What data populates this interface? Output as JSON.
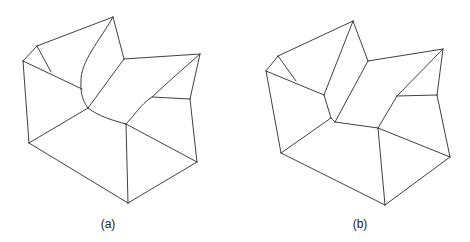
{
  "figure": {
    "panels": [
      {
        "id": "a",
        "label": "(a)",
        "label_pos": [
          108,
          218
        ],
        "description": "Polyhedral surface mesh with curved edges around central concave region",
        "lines": [
          [
            [
              113,
              17
            ],
            [
              37,
              46
            ]
          ],
          [
            [
              37,
              46
            ],
            [
              23,
              61
            ]
          ],
          [
            [
              37,
              46
            ],
            [
              51,
              72
            ]
          ],
          [
            [
              23,
              61
            ],
            [
              82,
              89
            ]
          ],
          [
            [
              23,
              61
            ],
            [
              29,
              143
            ]
          ],
          [
            [
              113,
              17
            ],
            [
              124,
              59
            ]
          ],
          [
            [
              124,
              59
            ],
            [
              200,
              54
            ]
          ],
          [
            [
              124,
              59
            ],
            [
              88,
              108
            ]
          ],
          [
            [
              200,
              54
            ],
            [
              190,
              99
            ]
          ],
          [
            [
              190,
              99
            ],
            [
              152,
              97
            ]
          ],
          [
            [
              190,
              99
            ],
            [
              197,
              162
            ]
          ],
          [
            [
              29,
              143
            ],
            [
              88,
              108
            ]
          ],
          [
            [
              29,
              143
            ],
            [
              128,
              203
            ]
          ],
          [
            [
              126,
              124
            ],
            [
              128,
              203
            ]
          ],
          [
            [
              126,
              124
            ],
            [
              197,
              162
            ]
          ],
          [
            [
              128,
              203
            ],
            [
              197,
              162
            ]
          ]
        ],
        "curves": [
          "M113,17 C100,40 80,62 81,82 C80,96 85,104 88,108",
          "M88,108 C100,117 112,120 126,124",
          "M126,124 C134,116 140,105 152,97 C168,82 184,68 200,54"
        ]
      },
      {
        "id": "b",
        "label": "(b)",
        "label_pos": [
          360,
          218
        ],
        "description": "Polyhedral surface mesh with straight edges (approximation of panel a)",
        "lines": [
          [
            [
              353,
              21
            ],
            [
              278,
              56
            ]
          ],
          [
            [
              278,
              56
            ],
            [
              266,
              71
            ]
          ],
          [
            [
              278,
              56
            ],
            [
              296,
              81
            ]
          ],
          [
            [
              266,
              71
            ],
            [
              324,
              95
            ]
          ],
          [
            [
              266,
              71
            ],
            [
              281,
              153
            ]
          ],
          [
            [
              353,
              21
            ],
            [
              324,
              95
            ]
          ],
          [
            [
              324,
              95
            ],
            [
              331,
              118
            ]
          ],
          [
            [
              331,
              118
            ],
            [
              335,
              122
            ]
          ],
          [
            [
              353,
              21
            ],
            [
              368,
              61
            ]
          ],
          [
            [
              368,
              61
            ],
            [
              443,
              49
            ]
          ],
          [
            [
              368,
              61
            ],
            [
              335,
              122
            ]
          ],
          [
            [
              443,
              49
            ],
            [
              437,
              95
            ]
          ],
          [
            [
              443,
              49
            ],
            [
              397,
              96
            ]
          ],
          [
            [
              397,
              96
            ],
            [
              437,
              95
            ]
          ],
          [
            [
              397,
              96
            ],
            [
              378,
              128
            ]
          ],
          [
            [
              437,
              95
            ],
            [
              450,
              157
            ]
          ],
          [
            [
              335,
              122
            ],
            [
              378,
              128
            ]
          ],
          [
            [
              281,
              153
            ],
            [
              331,
              118
            ]
          ],
          [
            [
              281,
              153
            ],
            [
              385,
              205
            ]
          ],
          [
            [
              378,
              128
            ],
            [
              385,
              205
            ]
          ],
          [
            [
              378,
              128
            ],
            [
              450,
              157
            ]
          ],
          [
            [
              385,
              205
            ],
            [
              450,
              157
            ]
          ]
        ],
        "curves": []
      }
    ],
    "colors": {
      "stroke": "#2a2a2a",
      "background": "#ffffff"
    }
  }
}
